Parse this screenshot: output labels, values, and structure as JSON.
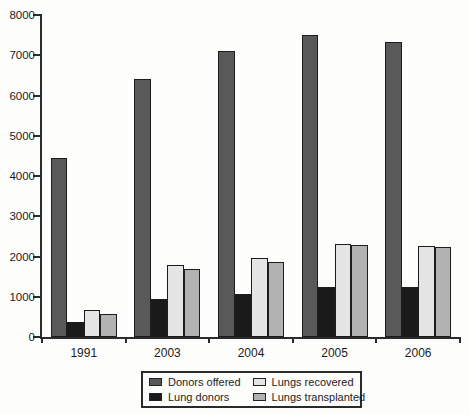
{
  "figure": {
    "background": "#fdfdfc"
  },
  "chart_data": {
    "type": "bar",
    "title": "",
    "xlabel": "",
    "ylabel": "",
    "categories": [
      "1991",
      "2003",
      "2004",
      "2005",
      "2006"
    ],
    "series": [
      {
        "name": "Donors offered",
        "color": "#595959",
        "values": [
          4450,
          6400,
          7100,
          7500,
          7330
        ]
      },
      {
        "name": "Lung donors",
        "color": "#1a1a1a",
        "values": [
          370,
          950,
          1060,
          1250,
          1240
        ]
      },
      {
        "name": "Lungs recovered",
        "color": "#e5e5e5",
        "values": [
          660,
          1780,
          1960,
          2320,
          2270
        ]
      },
      {
        "name": "Lungs transplanted",
        "color": "#b2b2b2",
        "values": [
          580,
          1680,
          1870,
          2290,
          2230
        ]
      }
    ],
    "ylim": [
      0,
      8000
    ],
    "yticks": [
      0,
      1000,
      2000,
      3000,
      4000,
      5000,
      6000,
      7000,
      8000
    ],
    "grid": false,
    "legend_position": "bottom-center",
    "legend_border": true,
    "axis_color": "#2b2b2b",
    "bar_border_color": "#1c1c1c"
  }
}
